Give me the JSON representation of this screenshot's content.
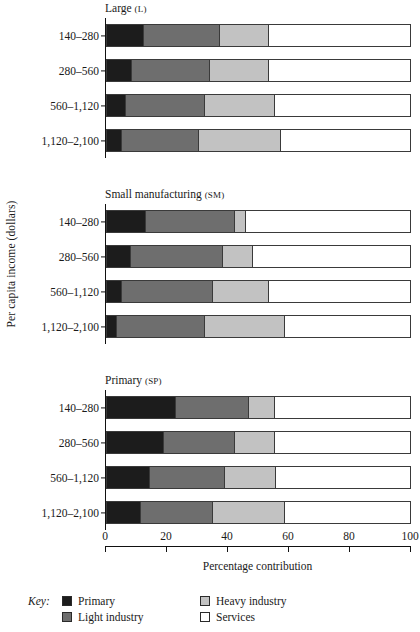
{
  "axes": {
    "ylabel": "Per capita income (dollars)",
    "xlabel": "Percentage contribution",
    "xticks": [
      "0",
      "20",
      "40",
      "60",
      "80",
      "100"
    ],
    "xlim": [
      0,
      100
    ],
    "categories": [
      "140–280",
      "280–560",
      "560–1,120",
      "1,120–2,100"
    ]
  },
  "panels": [
    {
      "title": "Large",
      "abbr": "(L)"
    },
    {
      "title": "Small manufacturing",
      "abbr": "(SM)"
    },
    {
      "title": "Primary",
      "abbr": "(SP)"
    }
  ],
  "legend": {
    "key_label": "Key:",
    "items": [
      {
        "label": "Primary",
        "color": "#1c1c1c"
      },
      {
        "label": "Light industry",
        "color": "#6e6e6e"
      },
      {
        "label": "Heavy industry",
        "color": "#c2c2c2"
      },
      {
        "label": "Services",
        "color": "#ffffff"
      }
    ]
  },
  "chart_data": {
    "type": "bar",
    "orientation": "horizontal",
    "stacked": true,
    "title": "",
    "xlabel": "Percentage contribution",
    "ylabel": "Per capita income (dollars)",
    "xlim": [
      0,
      100
    ],
    "grid": false,
    "legend_position": "bottom",
    "categories": [
      "140–280",
      "280–560",
      "560–1,120",
      "1,120–2,100"
    ],
    "series_names": [
      "Primary",
      "Light industry",
      "Heavy industry",
      "Services"
    ],
    "series_colors": [
      "#1c1c1c",
      "#6e6e6e",
      "#c2c2c2",
      "#ffffff"
    ],
    "panels": [
      {
        "name": "Large (L)",
        "series": [
          {
            "name": "Primary",
            "values": [
              12,
              8,
              6,
              4.5
            ]
          },
          {
            "name": "Light industry",
            "values": [
              25,
              25.5,
              26,
              25.5
            ]
          },
          {
            "name": "Heavy industry",
            "values": [
              16,
              19.5,
              23,
              27
            ]
          },
          {
            "name": "Services",
            "values": [
              47,
              47,
              45,
              43
            ]
          }
        ]
      },
      {
        "name": "Small manufacturing (SM)",
        "series": [
          {
            "name": "Primary",
            "values": [
              12.5,
              7.5,
              4.5,
              3
            ]
          },
          {
            "name": "Light industry",
            "values": [
              29.5,
              30.5,
              30,
              29
            ]
          },
          {
            "name": "Heavy industry",
            "values": [
              3.5,
              10,
              18.5,
              26.5
            ]
          },
          {
            "name": "Services",
            "values": [
              54.5,
              52,
              47,
              41.5
            ]
          }
        ]
      },
      {
        "name": "Primary (SP)",
        "series": [
          {
            "name": "Primary",
            "values": [
              22.5,
              18.5,
              14,
              11
            ]
          },
          {
            "name": "Light industry",
            "values": [
              24,
              23.5,
              24.5,
              23.5
            ]
          },
          {
            "name": "Heavy industry",
            "values": [
              8.5,
              13,
              17,
              24
            ]
          },
          {
            "name": "Services",
            "values": [
              45,
              45,
              44.5,
              41.5
            ]
          }
        ]
      }
    ]
  }
}
